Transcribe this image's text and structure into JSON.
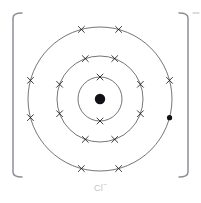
{
  "figure": {
    "label_text": "Cl",
    "label_charge": "−",
    "label_full": "Cl−",
    "background_color": "#ffffff",
    "shell_stroke_color": "#3a3a42",
    "bracket_color": "#8e9096",
    "electron_color": "#1b1b20",
    "nucleus_color": "#111116",
    "label_color": "#c2c4c9"
  },
  "brackets": {
    "left_x": 13,
    "right_x": 188,
    "top_y": 13,
    "bottom_y": 177,
    "charge_superscript": "−"
  },
  "chart_data": {
    "type": "scatter",
    "xlabel": "",
    "ylabel": "",
    "center": {
      "x": 100,
      "y": 99
    },
    "nucleus": {
      "radius": 5.2,
      "symbol": "Cl",
      "protons": 17,
      "style": "filled-dot"
    },
    "legend": [
      {
        "name": "electron (cross)",
        "marker": "x"
      },
      {
        "name": "gained electron (filled dot)",
        "marker": "dot"
      }
    ],
    "series": [
      {
        "name": "Shell 1",
        "radius": 22,
        "electron_count": 2,
        "values": [
          {
            "angle_deg": 90,
            "marker": "x"
          },
          {
            "angle_deg": 270,
            "marker": "x"
          }
        ]
      },
      {
        "name": "Shell 2",
        "radius": 43,
        "electron_count": 8,
        "values": [
          {
            "angle_deg": 70,
            "marker": "x"
          },
          {
            "angle_deg": 110,
            "marker": "x"
          },
          {
            "angle_deg": 160,
            "marker": "x"
          },
          {
            "angle_deg": 200,
            "marker": "x"
          },
          {
            "angle_deg": 250,
            "marker": "x"
          },
          {
            "angle_deg": 290,
            "marker": "x"
          },
          {
            "angle_deg": 340,
            "marker": "x"
          },
          {
            "angle_deg": 20,
            "marker": "x"
          }
        ]
      },
      {
        "name": "Shell 3",
        "radius": 72,
        "electron_count": 8,
        "values": [
          {
            "angle_deg": 75,
            "marker": "x"
          },
          {
            "angle_deg": 105,
            "marker": "x"
          },
          {
            "angle_deg": 165,
            "marker": "x"
          },
          {
            "angle_deg": 195,
            "marker": "x"
          },
          {
            "angle_deg": 255,
            "marker": "x"
          },
          {
            "angle_deg": 285,
            "marker": "x"
          },
          {
            "angle_deg": 15,
            "marker": "x"
          },
          {
            "angle_deg": 345,
            "marker": "dot"
          }
        ]
      }
    ],
    "electron_configuration": "2, 8, 8",
    "total_electrons": 18,
    "charge": "1-"
  }
}
